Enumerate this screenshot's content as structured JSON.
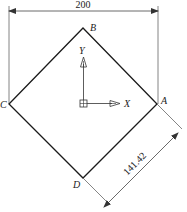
{
  "diagram": {
    "dimensions": {
      "width": "200",
      "side": "141.42"
    },
    "vertices": {
      "A": "A",
      "B": "B",
      "C": "C",
      "D": "D"
    },
    "axes": {
      "x": "X",
      "y": "Y"
    },
    "colors": {
      "outline": "#1a1a1a",
      "thin": "#555555"
    }
  }
}
